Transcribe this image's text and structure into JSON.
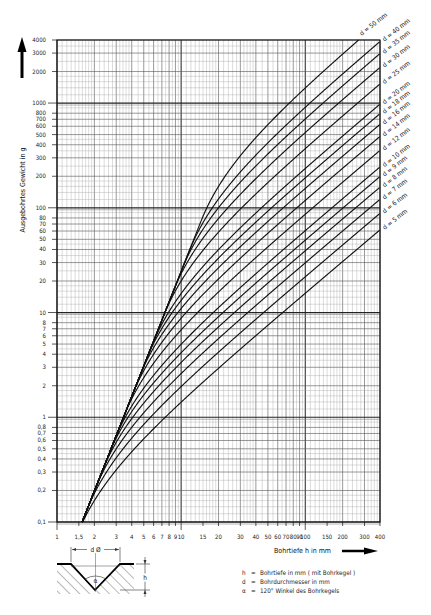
{
  "chart_data": {
    "type": "line",
    "title": "",
    "xlabel": "Bohrtiefe h in mm",
    "ylabel": "Ausgebohrtes Gewicht in g",
    "xscale": "log",
    "yscale": "log",
    "xlim": [
      1,
      400
    ],
    "ylim": [
      0.1,
      4000
    ],
    "grid": true,
    "legend_position": "curve labels at right end, rotated",
    "x_ticks": [
      1,
      1.5,
      2,
      3,
      4,
      5,
      6,
      7,
      8,
      9,
      10,
      15,
      20,
      30,
      40,
      50,
      60,
      70,
      80,
      90,
      100,
      150,
      200,
      300,
      400
    ],
    "x_tick_labels": [
      "1",
      "1,5",
      "2",
      "3",
      "4",
      "5",
      "6",
      "7",
      "8",
      "9",
      "10",
      "15",
      "20",
      "30",
      "40",
      "50",
      "60",
      "70",
      "80",
      "90",
      "100",
      "150",
      "200",
      "300",
      "400"
    ],
    "y_ticks": [
      0.1,
      0.2,
      0.3,
      0.4,
      0.5,
      0.6,
      0.7,
      0.8,
      1,
      2,
      3,
      4,
      5,
      6,
      7,
      8,
      10,
      20,
      30,
      40,
      50,
      60,
      70,
      80,
      100,
      200,
      300,
      400,
      500,
      600,
      700,
      800,
      1000,
      2000,
      3000,
      4000
    ],
    "y_tick_labels": [
      "0,1",
      "0,2",
      "0,3",
      "0,4",
      "0,5",
      "0,6",
      "0,7",
      "0,8",
      "1",
      "2",
      "3",
      "4",
      "5",
      "6",
      "7",
      "8",
      "10",
      "20",
      "30",
      "40",
      "50",
      "60",
      "70",
      "80",
      "100",
      "200",
      "300",
      "400",
      "500",
      "600",
      "700",
      "800",
      "1000",
      "2000",
      "3000",
      "4000"
    ],
    "model": {
      "description": "Weight of material removed by drill with 120° point (steel). Cone only for h <= 0.2887 d; cylinder + cone beyond.",
      "density_g_per_mm3": 0.00785,
      "cone_factor": 0.2887
    },
    "x": [
      1.5,
      2,
      3,
      5,
      10,
      20,
      50,
      100,
      200,
      400
    ],
    "series": [
      {
        "name": "d = 5 mm",
        "d": 5,
        "values": [
          0.083,
          0.16,
          0.314,
          0.622,
          1.39,
          2.93,
          7.56,
          15.3,
          30.7,
          61.5
        ]
      },
      {
        "name": "d = 6 mm",
        "d": 6,
        "values": [
          0.083,
          0.197,
          0.455,
          0.899,
          2.01,
          4.23,
          10.9,
          22.0,
          44.2,
          88.6
        ]
      },
      {
        "name": "d = 7 mm",
        "d": 7,
        "values": [
          0.083,
          0.197,
          0.6,
          1.22,
          2.74,
          5.76,
          14.8,
          30.0,
          60.2,
          120.6
        ]
      },
      {
        "name": "d = 8 mm",
        "d": 8,
        "values": [
          0.083,
          0.197,
          0.666,
          1.58,
          3.55,
          7.5,
          19.3,
          39.1,
          78.5,
          157.4
        ]
      },
      {
        "name": "d = 9 mm",
        "d": 9,
        "values": [
          0.083,
          0.197,
          0.666,
          1.97,
          4.5,
          9.5,
          24.5,
          49.5,
          99.5,
          199.5
        ]
      },
      {
        "name": "d = 10 mm",
        "d": 10,
        "values": [
          0.083,
          0.197,
          0.666,
          1.9,
          4.98,
          11.1,
          29.6,
          60.5,
          122,
          245
        ]
      },
      {
        "name": "d = 12 mm",
        "d": 12,
        "values": [
          0.083,
          0.197,
          0.666,
          2.42,
          6.69,
          15.6,
          42.2,
          86.6,
          175,
          353
        ]
      },
      {
        "name": "d = 14 mm",
        "d": 14,
        "values": [
          0.083,
          0.197,
          0.666,
          2.85,
          8.58,
          20.7,
          56.9,
          117,
          238,
          480
        ]
      },
      {
        "name": "d = 16 mm",
        "d": 16,
        "values": [
          0.083,
          0.197,
          0.666,
          3.08,
          10.7,
          26.4,
          73.7,
          152,
          310,
          626
        ]
      },
      {
        "name": "d = 18 mm",
        "d": 18,
        "values": [
          0.083,
          0.197,
          0.666,
          3.08,
          12.9,
          32.9,
          92.7,
          193,
          392,
          792
        ]
      },
      {
        "name": "d = 20 mm",
        "d": 20,
        "values": [
          0.083,
          0.197,
          0.666,
          3.08,
          15.2,
          39.8,
          114,
          237,
          484,
          977
        ]
      },
      {
        "name": "d = 25 mm",
        "d": 25,
        "values": [
          0.083,
          0.197,
          0.666,
          3.08,
          20.8,
          59.0,
          175,
          368,
          753,
          1524
        ]
      },
      {
        "name": "d = 30 mm",
        "d": 30,
        "values": [
          0.083,
          0.197,
          0.666,
          3.08,
          24.7,
          79.8,
          246,
          523,
          1078,
          2188
        ]
      },
      {
        "name": "d = 35 mm",
        "d": 35,
        "values": [
          0.083,
          0.197,
          0.666,
          3.08,
          24.7,
          104,
          330,
          708,
          1463,
          2974
        ]
      },
      {
        "name": "d = 40 mm",
        "d": 40,
        "values": [
          0.083,
          0.197,
          0.666,
          3.08,
          24.7,
          136,
          418,
          911,
          1898,
          3871
        ]
      },
      {
        "name": "d = 50 mm",
        "d": 50,
        "values": [
          0.083,
          0.197,
          0.666,
          3.08,
          24.7,
          160,
          622,
          1393,
          2934,
          6016
        ]
      }
    ],
    "annotations": [
      "d = 50 mm",
      "d = 40 mm",
      "d = 35 mm",
      "d = 30 mm",
      "d = 25 mm",
      "d = 20 mm",
      "d = 18 mm",
      "d = 16 mm",
      "d = 14 mm",
      "d = 12 mm",
      "d = 10 mm",
      "d = 9 mm",
      "d = 8 mm",
      "d = 7 mm",
      "d = 6 mm",
      "d = 5 mm"
    ]
  },
  "axis": {
    "y_title": "Ausgebohrtes Gewicht in g",
    "x_title": "Bohrtiefe h in mm"
  },
  "diagram": {
    "d_label": "d Ø",
    "h_label": "h",
    "alpha_label": "α"
  },
  "legend": [
    {
      "key": "h",
      "text": "Bohrtiefe in mm ( mit Bohrkegel )"
    },
    {
      "key": "d",
      "text": "Bohrdurchmesser in mm"
    },
    {
      "key": "α",
      "text": "120° Winkel des Bohrkegels"
    }
  ]
}
